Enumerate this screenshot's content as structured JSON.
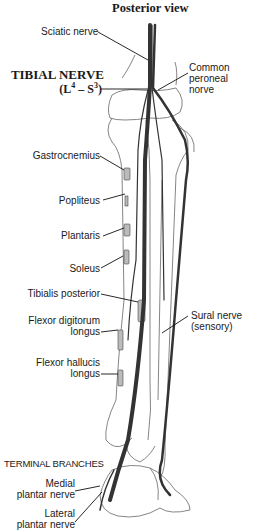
{
  "diagram": {
    "title": "Posterior view",
    "nerve_name": "TIBIAL NERVE",
    "nerve_roots": {
      "open": "(L",
      "l_sup": "4",
      "dash": " – S",
      "s_sup": "3",
      "close": ")"
    },
    "section_heading": "TERMINAL BRANCHES",
    "labels": {
      "sciatic": "Sciatic nerve",
      "common_peroneal": [
        "Common",
        "peroneal",
        "norve"
      ],
      "gastrocnemius": "Gastrocnemius",
      "popliteus": "Popliteus",
      "plantaris": "Plantaris",
      "soleus": "Soleus",
      "tibialis_posterior": "Tibialis posterior",
      "flexor_digitorum": [
        "Flexor digitorum",
        "longus"
      ],
      "flexor_hallucis": [
        "Flexor hallucis",
        "longus"
      ],
      "sural": [
        "Sural nerve",
        "(sensory)"
      ],
      "medial_plantar": [
        "Medial",
        "plantar nerve"
      ],
      "lateral_plantar": [
        "Lateral",
        "plantar nerve"
      ]
    },
    "colors": {
      "nerve": "#3a3a3a",
      "bone_outline": "#555555",
      "text": "#1a1a1a"
    }
  }
}
